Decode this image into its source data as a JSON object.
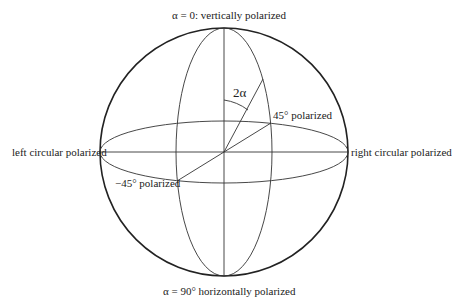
{
  "diagram": {
    "type": "poincare-sphere",
    "labels": {
      "top": "α = 0: vertically polarized",
      "bottom": "α = 90° horizontally polarized",
      "left": "left circular polarized",
      "right": "right circular polarized",
      "plus45": "45° polarized",
      "minus45": "−45° polarized",
      "angle": "2α"
    },
    "colors": {
      "stroke": "#222222",
      "background": "#ffffff"
    }
  }
}
